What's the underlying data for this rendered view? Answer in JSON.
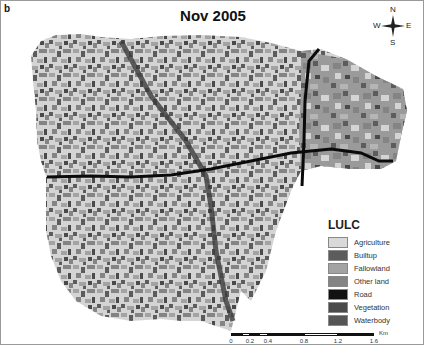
{
  "figure": {
    "panel_label": "b",
    "title": "Nov 2005"
  },
  "compass": {
    "north": "N",
    "south": "S",
    "east": "E",
    "west": "W"
  },
  "legend": {
    "title": "LULC",
    "items": [
      {
        "label": "Agriculture",
        "color": "#d9d9d9"
      },
      {
        "label": "Builtup",
        "color": "#5c5c5c"
      },
      {
        "label": "Fallowland",
        "color": "#a3a3a3"
      },
      {
        "label": "Other land",
        "color": "#848484"
      },
      {
        "label": "Road",
        "color": "#111111"
      },
      {
        "label": "Vegetation",
        "color": "#4a4a4a"
      },
      {
        "label": "Waterbody",
        "color": "#555555"
      }
    ]
  },
  "scalebar": {
    "unit": "Km",
    "ticks": [
      "0",
      "0.2",
      "0.4",
      "0.8",
      "1.2",
      "1.6"
    ]
  }
}
